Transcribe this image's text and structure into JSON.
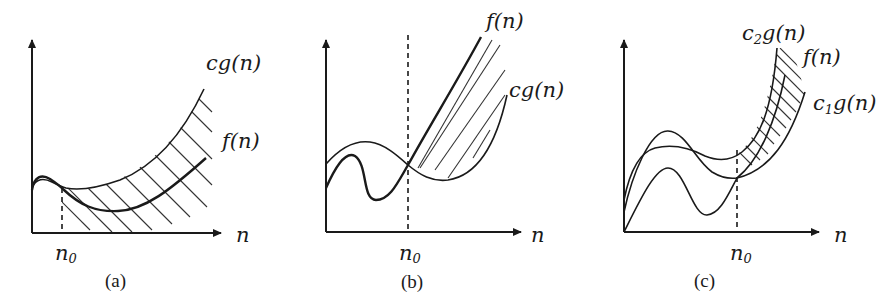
{
  "figure": {
    "panels": [
      {
        "id": "a",
        "caption": "(a)",
        "x_axis_label": "n",
        "threshold_label": "n",
        "threshold_subscript": "0",
        "curves": [
          {
            "name": "upper",
            "label": "cg(n)"
          },
          {
            "name": "lower",
            "label": "f(n)"
          }
        ],
        "meaning": "f(n) bounded above by cg(n) for n >= n0"
      },
      {
        "id": "b",
        "caption": "(b)",
        "x_axis_label": "n",
        "threshold_label": "n",
        "threshold_subscript": "0",
        "curves": [
          {
            "name": "upper",
            "label": "f(n)"
          },
          {
            "name": "lower",
            "label": "cg(n)"
          }
        ],
        "meaning": "f(n) bounded below by cg(n) for n >= n0"
      },
      {
        "id": "c",
        "caption": "(c)",
        "x_axis_label": "n",
        "threshold_label": "n",
        "threshold_subscript": "0",
        "curves": [
          {
            "name": "upper",
            "label_prefix": "c",
            "label_sub": "2",
            "label_suffix": "g(n)"
          },
          {
            "name": "middle",
            "label": "f(n)"
          },
          {
            "name": "lower",
            "label_prefix": "c",
            "label_sub": "1",
            "label_suffix": "g(n)"
          }
        ],
        "meaning": "f(n) bounded between c1g(n) and c2g(n) for n >= n0"
      }
    ]
  }
}
